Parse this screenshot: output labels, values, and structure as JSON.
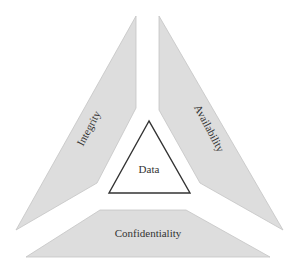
{
  "diagram": {
    "type": "cia-triad",
    "center": {
      "label": "Data"
    },
    "segments": [
      {
        "id": "integrity",
        "label": "Integrity",
        "position": "left"
      },
      {
        "id": "availability",
        "label": "Availability",
        "position": "right"
      },
      {
        "id": "confidentiality",
        "label": "Confidentiality",
        "position": "bottom"
      }
    ],
    "colors": {
      "segment_fill": "#dddddd",
      "segment_stroke": "#c4c4c4",
      "core_stroke": "#333333",
      "text": "#333333"
    }
  }
}
